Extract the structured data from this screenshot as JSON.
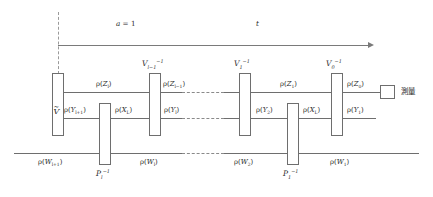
{
  "diagram": {
    "annotations": {
      "alpha_label": "a = 1",
      "time_label": "t"
    },
    "measurement": {
      "box_name": "measurement-box",
      "label": "測量"
    },
    "gates": [
      {
        "id": "g-vtilde",
        "base": "V",
        "tilde": true,
        "sub": "",
        "sup": "",
        "label_pos": "inside"
      },
      {
        "id": "g-pl",
        "base": "P",
        "tilde": false,
        "sub": "l",
        "sup": "-1",
        "label_pos": "below"
      },
      {
        "id": "g-vlm1",
        "base": "V",
        "tilde": false,
        "sub": "l-1",
        "sup": "-1",
        "label_pos": "above"
      },
      {
        "id": "g-v1",
        "base": "V",
        "tilde": false,
        "sub": "1",
        "sup": "-1",
        "label_pos": "above"
      },
      {
        "id": "g-p1",
        "base": "P",
        "tilde": false,
        "sub": "1",
        "sup": "-1",
        "label_pos": "below"
      },
      {
        "id": "g-v0",
        "base": "V",
        "tilde": false,
        "sub": "0",
        "sup": "-1",
        "label_pos": "above"
      }
    ],
    "gate_text": {
      "vtilde_inner": "V",
      "vlm1": "V",
      "vlm1_sub": "l−1",
      "vlm1_sup": "−1",
      "v1": "V",
      "v1_sub": "1",
      "v1_sup": "−1",
      "v0": "V",
      "v0_sub": "0",
      "v0_sup": "−1",
      "pl": "P",
      "pl_sub": "l",
      "pl_sup": "−1",
      "p1": "P",
      "p1_sub": "1",
      "p1_sup": "−1"
    },
    "wire_labels": {
      "top": [
        {
          "id": "rho-Zl",
          "rho": "ρ",
          "var": "Z",
          "sub": "l"
        },
        {
          "id": "rho-Zlm1",
          "rho": "ρ",
          "var": "Z",
          "sub": "l−1"
        },
        {
          "id": "rho-Z1",
          "rho": "ρ",
          "var": "Z",
          "sub": "1"
        },
        {
          "id": "rho-Z0",
          "rho": "ρ",
          "var": "Z",
          "sub": "0"
        }
      ],
      "middle": [
        {
          "id": "rho-Ylp1",
          "rho": "ρ",
          "var": "Y",
          "sub": "l+1"
        },
        {
          "id": "rho-XL-a",
          "rho": "ρ",
          "var": "X",
          "sub": "L"
        },
        {
          "id": "rho-Yl",
          "rho": "ρ",
          "var": "Y",
          "sub": "l"
        },
        {
          "id": "rho-Y2",
          "rho": "ρ",
          "var": "Y",
          "sub": "2"
        },
        {
          "id": "rho-XL-b",
          "rho": "ρ",
          "var": "X",
          "sub": "L"
        },
        {
          "id": "rho-Y1",
          "rho": "ρ",
          "var": "Y",
          "sub": "1"
        }
      ],
      "bottom": [
        {
          "id": "rho-Wlp1",
          "rho": "ρ",
          "var": "W",
          "sub": "l+1"
        },
        {
          "id": "rho-Wl",
          "rho": "ρ",
          "var": "W",
          "sub": "l"
        },
        {
          "id": "rho-W2",
          "rho": "ρ",
          "var": "W",
          "sub": "2"
        },
        {
          "id": "rho-W1",
          "rho": "ρ",
          "var": "W",
          "sub": "1"
        }
      ]
    },
    "colors": {
      "wire": "#6e6e6e",
      "dash": "#8a8a8a",
      "text": "#2b2b2b",
      "background": "#ffffff"
    }
  }
}
